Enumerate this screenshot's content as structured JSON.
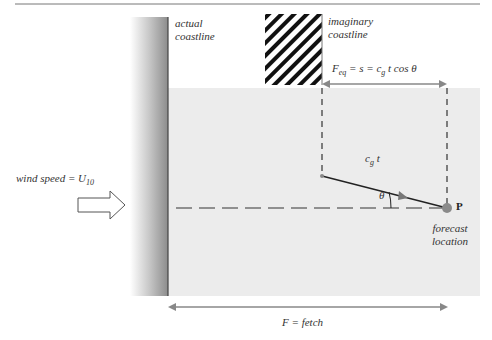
{
  "labels": {
    "actual_coastline": [
      "actual",
      "coastline"
    ],
    "imaginary_coastline": [
      "imaginary",
      "coastline"
    ],
    "feq_equation": "F_eq = s = c_g t cos θ",
    "feq_main": "F",
    "feq_sub": "eq",
    "feq_rest1": " = s = c",
    "feq_g": "g",
    "feq_rest2": "t cos θ",
    "cg_c": "c",
    "cg_g": "g",
    "cg_t": "t",
    "theta": "θ",
    "point": "P",
    "forecast_location": [
      "forecast",
      "location"
    ],
    "wind_speed": "wind speed = U",
    "wind_sub": "10",
    "fetch": "F = fetch"
  },
  "colors": {
    "sea": "#ececec",
    "line": "#333333",
    "arrow": "#888888",
    "point": "#8a8a8a"
  }
}
